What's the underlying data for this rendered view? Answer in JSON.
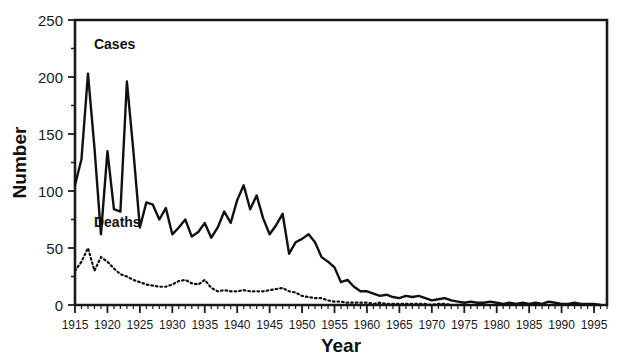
{
  "chart_data": {
    "type": "line",
    "title": "",
    "xlabel": "Year",
    "ylabel": "Number",
    "xlim": [
      1915,
      1997
    ],
    "ylim": [
      0,
      250
    ],
    "yticks": [
      0,
      50,
      100,
      150,
      200,
      250
    ],
    "xticks": [
      1915,
      1920,
      1925,
      1930,
      1935,
      1940,
      1945,
      1950,
      1955,
      1960,
      1965,
      1970,
      1975,
      1980,
      1985,
      1990,
      1995
    ],
    "minor_xtick_interval": 1,
    "grid": false,
    "legend": "inline-labels",
    "x": [
      1915,
      1916,
      1917,
      1918,
      1919,
      1920,
      1921,
      1922,
      1923,
      1924,
      1925,
      1926,
      1927,
      1928,
      1929,
      1930,
      1931,
      1932,
      1933,
      1934,
      1935,
      1936,
      1937,
      1938,
      1939,
      1940,
      1941,
      1942,
      1943,
      1944,
      1945,
      1946,
      1947,
      1948,
      1949,
      1950,
      1951,
      1952,
      1953,
      1954,
      1955,
      1956,
      1957,
      1958,
      1959,
      1960,
      1961,
      1962,
      1963,
      1964,
      1965,
      1966,
      1967,
      1968,
      1969,
      1970,
      1971,
      1972,
      1973,
      1974,
      1975,
      1976,
      1977,
      1978,
      1979,
      1980,
      1981,
      1982,
      1983,
      1984,
      1985,
      1986,
      1987,
      1988,
      1989,
      1990,
      1991,
      1992,
      1993,
      1994,
      1995,
      1996
    ],
    "series": [
      {
        "name": "Cases",
        "style": "solid",
        "label_x": 1917,
        "label_y": 225,
        "values": [
          105,
          128,
          203,
          138,
          62,
          135,
          84,
          82,
          196,
          135,
          68,
          90,
          88,
          75,
          85,
          62,
          68,
          75,
          60,
          64,
          72,
          59,
          68,
          82,
          72,
          92,
          105,
          84,
          96,
          76,
          62,
          70,
          80,
          45,
          55,
          58,
          62,
          55,
          42,
          38,
          33,
          20,
          22,
          16,
          12,
          12,
          10,
          8,
          9,
          7,
          6,
          8,
          7,
          8,
          6,
          4,
          5,
          6,
          4,
          3,
          2,
          3,
          2,
          2,
          3,
          2,
          1,
          2,
          1,
          2,
          1,
          2,
          1,
          3,
          2,
          1,
          1,
          2,
          1,
          1,
          1,
          0
        ]
      },
      {
        "name": "Deaths",
        "style": "dotted",
        "label_x": 1917,
        "label_y": 68,
        "values": [
          30,
          38,
          50,
          30,
          42,
          38,
          32,
          27,
          25,
          22,
          20,
          18,
          17,
          16,
          16,
          18,
          21,
          22,
          19,
          18,
          22,
          15,
          12,
          13,
          12,
          12,
          13,
          12,
          12,
          12,
          13,
          14,
          15,
          12,
          11,
          8,
          7,
          6,
          6,
          4,
          3,
          3,
          2,
          2,
          2,
          2,
          1,
          2,
          1,
          1,
          1,
          1,
          1,
          1,
          1,
          0,
          1,
          1,
          0,
          0,
          0,
          0,
          0,
          0,
          0,
          0,
          0,
          0,
          0,
          0,
          0,
          0,
          0,
          0,
          0,
          0,
          0,
          0,
          0,
          0,
          0,
          0
        ]
      }
    ]
  }
}
